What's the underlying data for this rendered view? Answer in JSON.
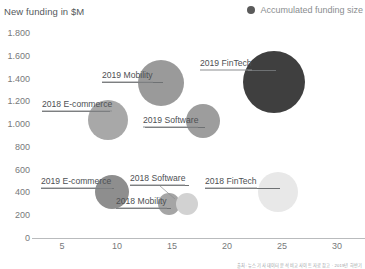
{
  "header": {
    "axis_title": "New funding in $M"
  },
  "legend": {
    "marker_icon": "circle-marker-icon",
    "label": "Accumulated funding size",
    "marker_color": "#5a5a5a",
    "position": "top-right"
  },
  "footer": {
    "source_note": "출처: 뉴스 기사 데이터 분석 비교 사이트 자료 참고 · 2019년 하반기"
  },
  "chart_data": {
    "type": "scatter",
    "title": "New funding in $M",
    "subtitle": "",
    "xlabel": "",
    "ylabel": "New funding in $M",
    "xlim": [
      0,
      32.5
    ],
    "ylim": [
      0,
      1800
    ],
    "xticks": [
      5,
      10,
      15,
      20,
      25,
      30
    ],
    "xtick_labels": [
      "5",
      "10",
      "15",
      "20",
      "25",
      "30"
    ],
    "yticks": [
      0,
      200,
      400,
      600,
      800,
      1000,
      1200,
      1400,
      1600,
      1800
    ],
    "ytick_labels": [
      "0",
      "200",
      "400",
      "600",
      "800",
      "1.000",
      "1.200",
      "1.400",
      "1.600",
      "1.800"
    ],
    "grid": false,
    "legend_entries": [
      "Accumulated funding size"
    ],
    "size_encodes": "Accumulated funding size",
    "points": [
      {
        "label": "2019 FinTech",
        "x": 24.3,
        "y": 1370,
        "size_r_px": 31,
        "color": "#3f3f3f",
        "px": 274,
        "py": 82,
        "label_px": 200,
        "label_py": 70,
        "label_w": 46,
        "leader_from": 248,
        "leader_to": 276,
        "leader_y": 70
      },
      {
        "label": "2019 Mobility",
        "x": 14.0,
        "y": 1360,
        "size_r_px": 23,
        "color": "#9a9a9a",
        "px": 161,
        "py": 83,
        "label_px": 102,
        "label_py": 82,
        "label_w": 51,
        "leader_from": 102,
        "leader_to": 163,
        "leader_y": 82
      },
      {
        "label": "2018 E-commerce",
        "x": 9.2,
        "y": 1036,
        "size_r_px": 20,
        "color": "#a8a8a8",
        "px": 108,
        "py": 120,
        "label_px": 42,
        "label_py": 111,
        "label_w": 70,
        "leader_from": 42,
        "leader_to": 110,
        "leader_y": 111
      },
      {
        "label": "2019 Software",
        "x": 17.8,
        "y": 1027,
        "size_r_px": 17,
        "color": "#9d9d9d",
        "px": 203,
        "py": 121,
        "label_px": 143,
        "label_py": 127,
        "label_w": 54,
        "leader_from": 145,
        "leader_to": 205,
        "leader_y": 127
      },
      {
        "label": "2019 E-commerce",
        "x": 9.5,
        "y": 404,
        "size_r_px": 17,
        "color": "#8e8e8e",
        "px": 112,
        "py": 192,
        "label_px": 41,
        "label_py": 188,
        "label_w": 71,
        "leader_from": 41,
        "leader_to": 114,
        "leader_y": 188
      },
      {
        "label": "2018 Mobility",
        "x": 14.7,
        "y": 299,
        "size_r_px": 11,
        "color": "#a5a5a5",
        "px": 169,
        "py": 204,
        "label_px": 116,
        "label_py": 208,
        "label_w": 50,
        "leader_from": 116,
        "leader_to": 171,
        "leader_y": 208
      },
      {
        "label": "2018 Software",
        "x": 16.4,
        "y": 299,
        "size_r_px": 11,
        "color": "#d2d2d2",
        "px": 187,
        "py": 204,
        "label_px": 130,
        "label_py": 185,
        "label_w": 55,
        "leader_from": 130,
        "leader_to": 189,
        "leader_y": 185
      },
      {
        "label": "2018 FinTech",
        "x": 24.6,
        "y": 404,
        "size_r_px": 20,
        "color": "#e8e8e8",
        "px": 278,
        "py": 192,
        "label_px": 205,
        "label_py": 188,
        "label_w": 52,
        "leader_from": 205,
        "leader_to": 280,
        "leader_y": 188
      }
    ]
  }
}
